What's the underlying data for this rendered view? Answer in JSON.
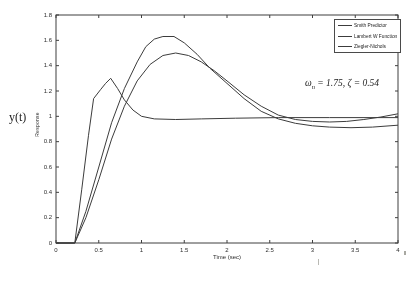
{
  "figure": {
    "x_axis_label": "Time (sec)",
    "y_axis_label": "y(t)",
    "y_axis_rotated_label": "Response",
    "annotation": {
      "omega_symbol": "ω",
      "omega_subscript": "n",
      "equals_rest": " = 1.75, ζ = 0.54"
    }
  },
  "chart_data": {
    "type": "line",
    "title": "",
    "xlabel": "Time (sec)",
    "ylabel": "Response",
    "ylabel_secondary": "y(t)",
    "annotation_text": "ω_n = 1.75, ζ = 0.54",
    "xlim": [
      0,
      4
    ],
    "ylim": [
      0,
      1.8
    ],
    "xticks": [
      0,
      0.5,
      1,
      1.5,
      2,
      2.5,
      3,
      3.5,
      4
    ],
    "yticks": [
      0,
      0.2,
      0.4,
      0.6,
      0.8,
      1,
      1.2,
      1.4,
      1.6,
      1.8
    ],
    "grid": false,
    "legend_position": "top-right",
    "axis_color": "#3f3f3f",
    "line_color": "#3c3c3c",
    "series": [
      {
        "name": "Smith Predictor",
        "points": [
          [
            0,
            0
          ],
          [
            0.22,
            0
          ],
          [
            0.3,
            0.42
          ],
          [
            0.38,
            0.85
          ],
          [
            0.44,
            1.14
          ],
          [
            0.52,
            1.21
          ],
          [
            0.58,
            1.26
          ],
          [
            0.64,
            1.3
          ],
          [
            0.72,
            1.22
          ],
          [
            0.8,
            1.13
          ],
          [
            0.9,
            1.05
          ],
          [
            1.0,
            1.0
          ],
          [
            1.15,
            0.98
          ],
          [
            1.4,
            0.975
          ],
          [
            1.7,
            0.98
          ],
          [
            2.1,
            0.985
          ],
          [
            2.6,
            0.99
          ],
          [
            3.2,
            0.99
          ],
          [
            4.0,
            0.99
          ]
        ]
      },
      {
        "name": "Lambert W Function",
        "points": [
          [
            0,
            0
          ],
          [
            0.22,
            0
          ],
          [
            0.35,
            0.2
          ],
          [
            0.5,
            0.5
          ],
          [
            0.65,
            0.82
          ],
          [
            0.8,
            1.08
          ],
          [
            0.95,
            1.28
          ],
          [
            1.1,
            1.41
          ],
          [
            1.25,
            1.48
          ],
          [
            1.4,
            1.5
          ],
          [
            1.55,
            1.48
          ],
          [
            1.7,
            1.43
          ],
          [
            1.85,
            1.36
          ],
          [
            2.0,
            1.28
          ],
          [
            2.2,
            1.17
          ],
          [
            2.4,
            1.08
          ],
          [
            2.6,
            1.01
          ],
          [
            2.8,
            0.975
          ],
          [
            3.0,
            0.96
          ],
          [
            3.2,
            0.955
          ],
          [
            3.4,
            0.96
          ],
          [
            3.6,
            0.975
          ],
          [
            3.8,
            0.995
          ],
          [
            4.0,
            1.02
          ]
        ]
      },
      {
        "name": "Ziegler-Nichols",
        "points": [
          [
            0,
            0
          ],
          [
            0.22,
            0
          ],
          [
            0.35,
            0.25
          ],
          [
            0.5,
            0.6
          ],
          [
            0.65,
            0.95
          ],
          [
            0.8,
            1.22
          ],
          [
            0.95,
            1.43
          ],
          [
            1.05,
            1.55
          ],
          [
            1.15,
            1.61
          ],
          [
            1.25,
            1.63
          ],
          [
            1.38,
            1.63
          ],
          [
            1.5,
            1.58
          ],
          [
            1.65,
            1.49
          ],
          [
            1.8,
            1.38
          ],
          [
            2.0,
            1.26
          ],
          [
            2.2,
            1.14
          ],
          [
            2.4,
            1.04
          ],
          [
            2.6,
            0.98
          ],
          [
            2.8,
            0.945
          ],
          [
            3.0,
            0.925
          ],
          [
            3.2,
            0.915
          ],
          [
            3.45,
            0.91
          ],
          [
            3.7,
            0.915
          ],
          [
            4.0,
            0.93
          ]
        ]
      }
    ]
  }
}
